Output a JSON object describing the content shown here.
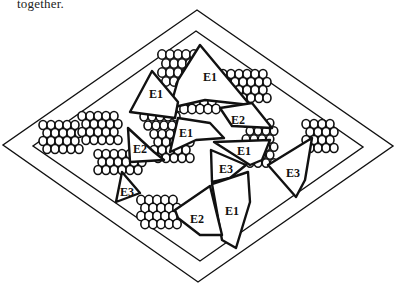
{
  "caption": "together.",
  "diagram": {
    "outer_diamond": [
      [
        197,
        10
      ],
      [
        393,
        146
      ],
      [
        198,
        282
      ],
      [
        3,
        145
      ]
    ],
    "inner_diamond": [
      [
        196,
        31
      ],
      [
        363,
        147
      ],
      [
        200,
        261
      ],
      [
        33,
        146
      ]
    ],
    "colors": {
      "stroke": "#111111",
      "background": "#ffffff"
    },
    "cells": [
      {
        "label": "E1",
        "points": [
          [
            200,
            45
          ],
          [
            250,
            105
          ],
          [
            205,
            100
          ],
          [
            170,
            108
          ],
          [
            178,
            80
          ]
        ],
        "label_pos": [
          210,
          78
        ]
      },
      {
        "label": "E1",
        "points": [
          [
            152,
            71
          ],
          [
            178,
            102
          ],
          [
            175,
            118
          ],
          [
            130,
            112
          ]
        ],
        "label_pos": [
          156,
          95
        ]
      },
      {
        "label": "E2",
        "points": [
          [
            220,
            108
          ],
          [
            252,
            103
          ],
          [
            272,
            128
          ],
          [
            232,
            126
          ]
        ],
        "label_pos": [
          238,
          121
        ]
      },
      {
        "label": "E1",
        "points": [
          [
            178,
            118
          ],
          [
            210,
            123
          ],
          [
            224,
            138
          ],
          [
            196,
            140
          ],
          [
            170,
            152
          ]
        ],
        "label_pos": [
          186,
          134
        ]
      },
      {
        "label": "E2",
        "points": [
          [
            128,
            128
          ],
          [
            154,
            152
          ],
          [
            164,
            160
          ],
          [
            130,
            162
          ]
        ],
        "label_pos": [
          140,
          150
        ]
      },
      {
        "label": "E1",
        "points": [
          [
            214,
            142
          ],
          [
            270,
            140
          ],
          [
            262,
            160
          ],
          [
            250,
            165
          ]
        ],
        "label_pos": [
          244,
          152
        ]
      },
      {
        "label": "E3",
        "points": [
          [
            211,
            150
          ],
          [
            246,
            165
          ],
          [
            230,
            178
          ],
          [
            212,
            182
          ]
        ],
        "label_pos": [
          226,
          170
        ]
      },
      {
        "label": "E3",
        "points": [
          [
            312,
            138
          ],
          [
            305,
            180
          ],
          [
            296,
            197
          ],
          [
            268,
            165
          ]
        ],
        "label_pos": [
          293,
          174
        ]
      },
      {
        "label": "E3",
        "points": [
          [
            122,
            172
          ],
          [
            140,
            193
          ],
          [
            116,
            202
          ]
        ],
        "label_pos": [
          127,
          193
        ]
      },
      {
        "label": "E1",
        "points": [
          [
            212,
            184
          ],
          [
            248,
            172
          ],
          [
            250,
            202
          ],
          [
            236,
            248
          ],
          [
            222,
            240
          ]
        ],
        "label_pos": [
          232,
          212
        ]
      },
      {
        "label": "E2",
        "points": [
          [
            175,
            210
          ],
          [
            210,
            186
          ],
          [
            222,
            235
          ],
          [
            200,
            235
          ],
          [
            178,
            218
          ]
        ],
        "label_pos": [
          197,
          220
        ]
      }
    ],
    "circle_clusters": [
      {
        "cx": 178,
        "cy": 68,
        "cols": 5,
        "rows": 4,
        "r": 4.2,
        "dx": 8,
        "dy": 9
      },
      {
        "cx": 160,
        "cy": 112,
        "cols": 5,
        "rows": 4,
        "r": 4,
        "dx": 8,
        "dy": 9
      },
      {
        "cx": 196,
        "cy": 97,
        "cols": 5,
        "rows": 4,
        "r": 4.2,
        "dx": 8,
        "dy": 8
      },
      {
        "cx": 243,
        "cy": 86,
        "cols": 6,
        "rows": 4,
        "r": 4,
        "dx": 8,
        "dy": 8
      },
      {
        "cx": 59,
        "cy": 137,
        "cols": 5,
        "rows": 4,
        "r": 4,
        "dx": 8,
        "dy": 8
      },
      {
        "cx": 98,
        "cy": 128,
        "cols": 5,
        "rows": 4,
        "r": 4,
        "dx": 8,
        "dy": 8
      },
      {
        "cx": 118,
        "cy": 162,
        "cols": 6,
        "rows": 3,
        "r": 4,
        "dx": 8,
        "dy": 8
      },
      {
        "cx": 170,
        "cy": 146,
        "cols": 5,
        "rows": 4,
        "r": 4,
        "dx": 8,
        "dy": 8
      },
      {
        "cx": 258,
        "cy": 143,
        "cols": 4,
        "rows": 6,
        "r": 3.8,
        "dx": 8,
        "dy": 8
      },
      {
        "cx": 318,
        "cy": 136,
        "cols": 4,
        "rows": 4,
        "r": 4,
        "dx": 8,
        "dy": 8
      },
      {
        "cx": 157,
        "cy": 212,
        "cols": 5,
        "rows": 4,
        "r": 4.2,
        "dx": 8,
        "dy": 8
      }
    ]
  }
}
